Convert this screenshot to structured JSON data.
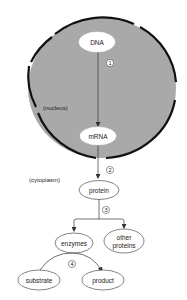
{
  "diagram": {
    "title": "",
    "colors": {
      "nucleus_fill": "#a9a9a9",
      "envelope": "#111111",
      "node_fill": "#ffffff",
      "node_stroke": "#333333",
      "arrow": "#333333",
      "background": "#ffffff"
    },
    "regions": {
      "nucleus": "(nucleus)",
      "cytoplasm": "(cytoplasm)"
    },
    "nodes": {
      "dna": "DNA",
      "mrna": "mRNA",
      "protein": "protein",
      "enzymes": "enzymes",
      "other_proteins_line1": "other",
      "other_proteins_line2": "proteins",
      "substrate": "substrate",
      "product": "product"
    },
    "steps": {
      "s1": "1",
      "s2": "2",
      "s3": "3",
      "s4": "4"
    },
    "edges": [
      {
        "from": "DNA",
        "to": "mRNA",
        "step": "1"
      },
      {
        "from": "mRNA",
        "to": "protein",
        "step": "2"
      },
      {
        "from": "protein",
        "to": "enzymes",
        "step": "3"
      },
      {
        "from": "protein",
        "to": "other proteins",
        "step": "3"
      },
      {
        "from": "substrate",
        "to": "product",
        "step": "4",
        "via": "enzymes"
      }
    ]
  }
}
